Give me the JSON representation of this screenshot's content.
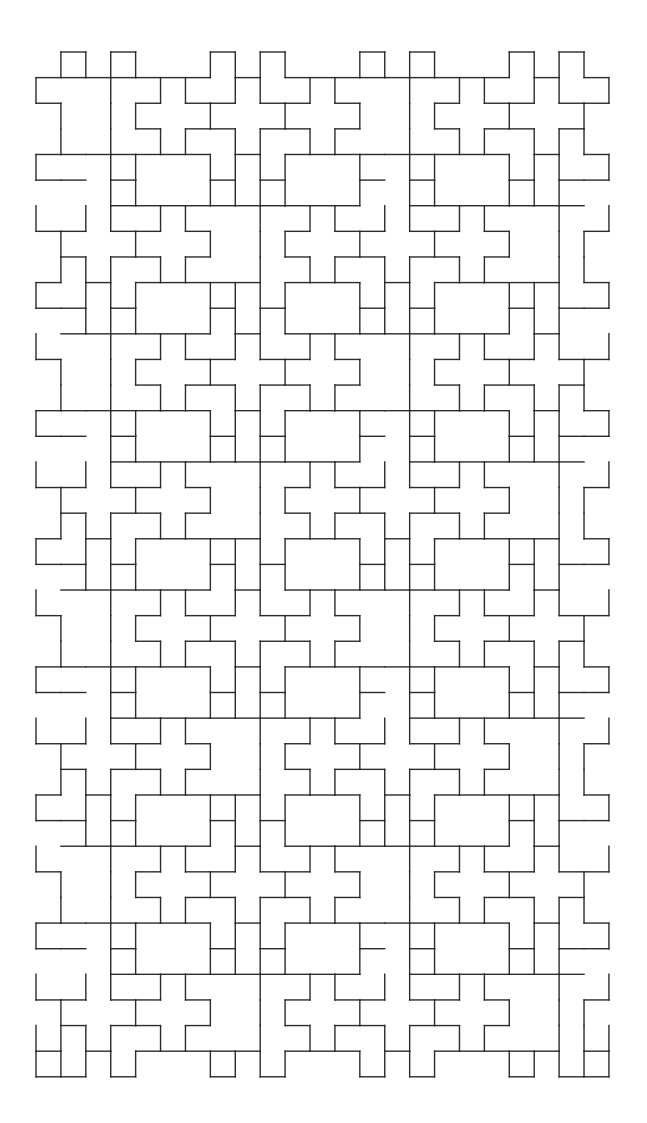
{
  "figure": {
    "stroke_color": "#2b2b2b",
    "background_color": "#ffffff",
    "grid": {
      "origin_x": 36,
      "origin_y": 52,
      "unit_x": 24.91,
      "unit_y": 25.62,
      "cols": 23,
      "rows": 40
    },
    "big_rect_columns": [
      4,
      10,
      16
    ],
    "narrow_rect_columns": [
      2,
      8,
      14,
      20
    ],
    "rect_rows": [
      4,
      9,
      14,
      19,
      24,
      29,
      34
    ],
    "top_tab_columns": [
      1,
      3,
      7,
      9,
      13,
      15,
      19,
      21
    ],
    "bottom_tab_columns": [
      1,
      3,
      7,
      9,
      13,
      15,
      19,
      21
    ]
  }
}
